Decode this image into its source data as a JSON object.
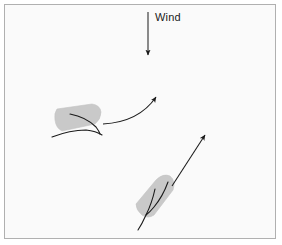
{
  "figure": {
    "width": 282,
    "height": 245,
    "background_color": "#fafafa",
    "border_color": "#b0b0b0",
    "page_color": "#ffffff"
  },
  "annotations": {
    "wind_label": "Wind"
  },
  "colors": {
    "sail_fill": "#c9c9c9",
    "sail_stroke": "#bdbdbd",
    "line_stroke": "#1a1a1a",
    "text": "#1a1a1a"
  },
  "wind_arrow": {
    "name": "wind-direction-arrow",
    "direction": "down",
    "x": 148,
    "y_start": 12,
    "y_end": 56
  },
  "objects": [
    {
      "name": "sail-shape-upper-left",
      "label": "",
      "centroid_x": 76,
      "centroid_y": 120,
      "rotation_deg": -8
    },
    {
      "name": "sail-shape-lower-right",
      "label": "",
      "centroid_x": 155,
      "centroid_y": 196,
      "rotation_deg": -52
    }
  ],
  "trajectories": [
    {
      "name": "curved-trajectory-arrow",
      "style": "curved",
      "start_x": 103,
      "start_y": 124,
      "end_x": 162,
      "end_y": 88
    },
    {
      "name": "straight-trajectory-arrow",
      "style": "straight",
      "start_x": 172,
      "start_y": 186,
      "end_x": 209,
      "end_y": 130
    }
  ]
}
